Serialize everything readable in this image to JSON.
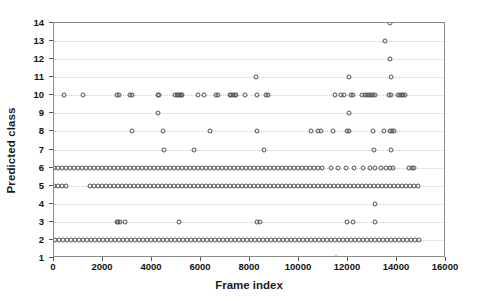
{
  "chart_data": {
    "type": "scatter",
    "title": "",
    "xlabel": "Frame index",
    "ylabel": "Predicted class",
    "xlim": [
      0,
      16000
    ],
    "ylim": [
      1,
      14
    ],
    "grid": true,
    "legend": null,
    "marker": "open-circle",
    "marker_color": "#4f4f4f",
    "xticks": [
      0,
      2000,
      4000,
      6000,
      8000,
      10000,
      12000,
      14000,
      16000
    ],
    "xtick_labels": [
      "0",
      "2000",
      "4000",
      "6000",
      "8000",
      "10000",
      "12000",
      "14000",
      "16000"
    ],
    "yticks": [
      1,
      2,
      3,
      4,
      5,
      6,
      7,
      8,
      9,
      10,
      11,
      12,
      13,
      14
    ],
    "ytick_labels": [
      "1",
      "2",
      "3",
      "4",
      "5",
      "6",
      "7",
      "8",
      "9",
      "10",
      "11",
      "12",
      "13",
      "14"
    ],
    "series": [
      {
        "name": "Predicted class vs frame index",
        "class_rows": [
          {
            "class": 1,
            "x": [
              11490
            ]
          },
          {
            "class": 2,
            "ranges": [
              [
                40,
                15000
              ]
            ],
            "density": 4
          },
          {
            "class": 3,
            "x": [
              2560,
              2620,
              2700,
              2880,
              5110,
              8280,
              8400,
              11970,
              12200,
              13090
            ]
          },
          {
            "class": 4,
            "x": [
              13090
            ]
          },
          {
            "class": 5,
            "ranges": [
              [
                10,
                560
              ],
              [
                1450,
                15000
              ]
            ],
            "density": 4
          },
          {
            "class": 6,
            "ranges": [
              [
                10,
                11000
              ]
            ],
            "density": 4,
            "x": [
              11300,
              11600,
              11900,
              12250,
              12600,
              12900,
              13100,
              13350,
              13550,
              13700,
              13850,
              14500,
              14620,
              14700
            ]
          },
          {
            "class": 7,
            "x": [
              4470,
              5720,
              8580,
              13080,
              13760
            ]
          },
          {
            "class": 8,
            "x": [
              3190,
              4450,
              6370,
              8280,
              10480,
              10780,
              10900,
              11400,
              11960,
              12060,
              13000,
              13480,
              13700,
              13800,
              13870
            ]
          },
          {
            "class": 9,
            "x": [
              4230,
              12040
            ]
          },
          {
            "class": 10,
            "x": [
              420,
              1190,
              2580,
              2640,
              3110,
              3170,
              4230,
              4300,
              4920,
              5000,
              5060,
              5130,
              5180,
              5240,
              5880,
              6120,
              6620,
              6700,
              7180,
              7230,
              7300,
              7370,
              7440,
              7810,
              8270,
              8660,
              8720,
              11450,
              11700,
              11840,
              12130,
              12200,
              12580,
              12700,
              12780,
              12860,
              12940,
              13030,
              13100,
              13680,
              13760,
              14060,
              14130,
              14200,
              14260,
              14320
            ]
          },
          {
            "class": 11,
            "x": [
              8250,
              12050,
              13760
            ]
          },
          {
            "class": 12,
            "x": [
              13720
            ]
          },
          {
            "class": 13,
            "x": [
              13530
            ]
          },
          {
            "class": 14,
            "x": [
              13700
            ]
          }
        ]
      }
    ]
  },
  "axes": {
    "x_title": "Frame index",
    "y_title": "Predicted class"
  }
}
